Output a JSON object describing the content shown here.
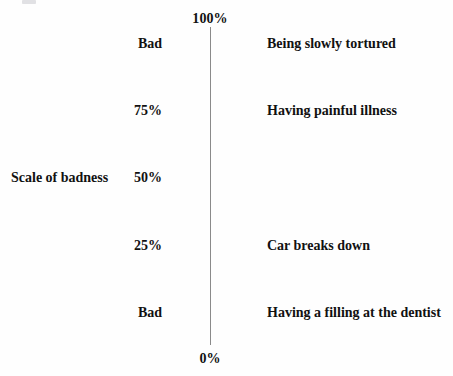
{
  "figure": {
    "axis_title": "Scale of badness",
    "line_color": "#8a8a8a",
    "text_color": "#111111",
    "background": "#fefefe",
    "top_cap": "100%",
    "bottom_cap": "0%"
  },
  "rows": [
    {
      "tick": "Bad",
      "anchor": "Being slowly tortured",
      "top": 36
    },
    {
      "tick": "75%",
      "anchor": "Having painful illness",
      "top": 103
    },
    {
      "tick": "50%",
      "anchor": "",
      "top": 170
    },
    {
      "tick": "25%",
      "anchor": "Car breaks down",
      "top": 238
    },
    {
      "tick": "Bad",
      "anchor": "Having a filling at the dentist",
      "top": 305
    }
  ],
  "axis_title_row_index": 2,
  "chart_data": {
    "type": "scatter",
    "title": "",
    "subtitle": "",
    "orientation": "vertical",
    "xlabel": "",
    "ylabel": "Scale of badness",
    "ylim": [
      0,
      100
    ],
    "yunit": "%",
    "grid": false,
    "legend": null,
    "axis_endpoint_labels": {
      "top": "100%",
      "bottom": "0%"
    },
    "tick_labels": [
      "Bad",
      "75%",
      "50%",
      "25%",
      "Bad"
    ],
    "tick_values": [
      100,
      75,
      50,
      25,
      0
    ],
    "anchors": [
      {
        "value": 100,
        "tick_label": "Bad",
        "label": "Being slowly tortured"
      },
      {
        "value": 75,
        "tick_label": "75%",
        "label": "Having painful illness"
      },
      {
        "value": 50,
        "tick_label": "50%",
        "label": ""
      },
      {
        "value": 25,
        "tick_label": "25%",
        "label": "Car breaks down"
      },
      {
        "value": 0,
        "tick_label": "Bad",
        "label": "Having a filling at the dentist"
      }
    ],
    "annotations": [
      "Scale of badness"
    ]
  }
}
